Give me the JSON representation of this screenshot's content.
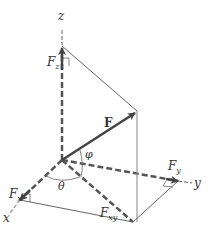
{
  "diagram": {
    "axes": {
      "x": "x",
      "y": "y",
      "z": "z"
    },
    "vector_label": "F",
    "components": {
      "fx": "F",
      "fx_sub": "x",
      "fy": "F",
      "fy_sub": "y",
      "fz": "F",
      "fz_sub": "z",
      "fxy": "F",
      "fxy_sub": "xy"
    },
    "angles": {
      "theta": "θ",
      "phi": "φ"
    },
    "colors": {
      "axis": "#555555",
      "vector": "#444444",
      "thin": "#666666",
      "background": "#ffffff"
    }
  }
}
